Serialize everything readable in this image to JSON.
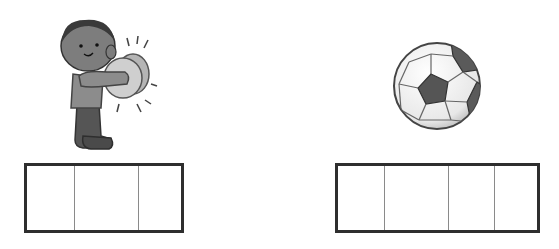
{
  "exercise": {
    "items": [
      {
        "picture": "boy-with-cymbals-icon",
        "letter_box": {
          "cells": [
            "",
            "",
            ""
          ],
          "cell_widths": [
            47,
            64,
            47
          ]
        }
      },
      {
        "picture": "soccer-ball-icon",
        "letter_box": {
          "cells": [
            "",
            "",
            "",
            ""
          ],
          "cell_widths": [
            47,
            64,
            46,
            47
          ]
        }
      }
    ]
  },
  "colors": {
    "box_border": "#2e2e2e",
    "cell_divider": "#8a8a8a",
    "background": "#ffffff"
  }
}
